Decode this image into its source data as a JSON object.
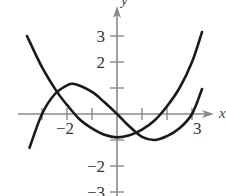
{
  "panel_label": ".",
  "chart_data": {
    "type": "line",
    "title": "",
    "xlabel": "x",
    "ylabel": "y",
    "xlim": [
      -3.6,
      3.8
    ],
    "ylim": [
      -3.1,
      3.6
    ],
    "grid": false,
    "legend": null,
    "x_ticks": [
      -3,
      -2,
      -1,
      0,
      1,
      2,
      3
    ],
    "x_tick_labels": [
      {
        "value": -2,
        "label": "−2"
      },
      {
        "value": 3,
        "label": "3"
      }
    ],
    "y_ticks": [
      -3,
      -2,
      -1,
      1,
      2,
      3
    ],
    "y_tick_labels": [
      {
        "value": 3,
        "label": "3"
      },
      {
        "value": 2,
        "label": "2"
      },
      {
        "value": -2,
        "label": "−2"
      },
      {
        "value": -3,
        "label": "−3"
      }
    ],
    "series": [
      {
        "name": "parabola",
        "description": "Opens upward, vertex near (0, -0.9)",
        "x": [
          -3.6,
          -3,
          -2.4,
          -2,
          -1.5,
          -1,
          -0.5,
          0,
          0.5,
          1,
          1.5,
          2,
          2.5,
          3,
          3.4
        ],
        "y": [
          3.0,
          1.8,
          0.85,
          0.35,
          -0.2,
          -0.55,
          -0.8,
          -0.9,
          -0.82,
          -0.6,
          -0.25,
          0.3,
          1.0,
          2.0,
          3.15
        ]
      },
      {
        "name": "cubic",
        "description": "Zeros near x = -3, 0, 3; local max near (-1.7, 1.15), local min near (1.5, -1.0)",
        "x": [
          -3.5,
          -3,
          -2.5,
          -2,
          -1.7,
          -1,
          -0.5,
          0,
          0.5,
          1,
          1.5,
          2,
          2.5,
          3,
          3.4
        ],
        "y": [
          -1.3,
          0,
          0.75,
          1.1,
          1.15,
          0.85,
          0.45,
          0,
          -0.48,
          -0.88,
          -1.0,
          -0.85,
          -0.55,
          0,
          0.96
        ]
      }
    ],
    "intersections_approx": [
      [
        -2.4,
        0.95
      ],
      [
        0.85,
        -0.75
      ]
    ]
  }
}
